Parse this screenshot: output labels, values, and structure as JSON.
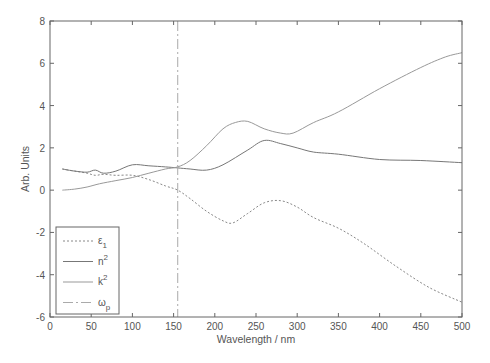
{
  "chart_data": {
    "type": "line",
    "title": "",
    "xlabel": "Wavelength / nm",
    "ylabel": "Arb. Units",
    "xlim": [
      0,
      500
    ],
    "ylim": [
      -6,
      8
    ],
    "xticks": [
      0,
      50,
      100,
      150,
      200,
      250,
      300,
      350,
      400,
      450,
      500
    ],
    "yticks": [
      -6,
      -4,
      -2,
      0,
      2,
      4,
      6,
      8
    ],
    "grid": false,
    "legend_position": "lower left",
    "series": [
      {
        "name": "ε1",
        "label_main": "ε",
        "label_sub": "1",
        "style": "dotted",
        "color": "#888888",
        "x": [
          15,
          30,
          45,
          55,
          65,
          80,
          100,
          120,
          140,
          155,
          170,
          190,
          210,
          222,
          240,
          260,
          280,
          300,
          320,
          350,
          380,
          420,
          460,
          500
        ],
        "y": [
          1.0,
          0.9,
          0.8,
          0.7,
          0.75,
          0.7,
          0.7,
          0.5,
          0.2,
          0.0,
          -0.4,
          -1.0,
          -1.45,
          -1.55,
          -1.1,
          -0.6,
          -0.5,
          -0.8,
          -1.3,
          -1.8,
          -2.5,
          -3.6,
          -4.6,
          -5.3
        ]
      },
      {
        "name": "n2",
        "label_main": "n",
        "label_sub": "2",
        "superscript": true,
        "style": "solid",
        "color": "#777777",
        "x": [
          15,
          30,
          45,
          55,
          65,
          80,
          100,
          120,
          140,
          155,
          170,
          190,
          210,
          240,
          260,
          280,
          300,
          320,
          350,
          400,
          450,
          500
        ],
        "y": [
          1.0,
          0.9,
          0.85,
          0.95,
          0.8,
          0.9,
          1.2,
          1.15,
          1.1,
          1.05,
          1.0,
          0.95,
          1.2,
          1.9,
          2.35,
          2.2,
          2.0,
          1.8,
          1.7,
          1.45,
          1.4,
          1.3
        ]
      },
      {
        "name": "k2",
        "label_main": "k",
        "label_sub": "2",
        "superscript": true,
        "style": "solid",
        "color": "#999999",
        "x": [
          15,
          30,
          45,
          60,
          80,
          100,
          120,
          140,
          155,
          170,
          190,
          210,
          225,
          240,
          260,
          280,
          295,
          320,
          350,
          400,
          450,
          480,
          500
        ],
        "y": [
          0.0,
          0.05,
          0.15,
          0.3,
          0.45,
          0.6,
          0.8,
          1.0,
          1.1,
          1.4,
          2.1,
          2.9,
          3.2,
          3.25,
          2.9,
          2.7,
          2.7,
          3.2,
          3.7,
          4.8,
          5.8,
          6.3,
          6.5
        ]
      },
      {
        "name": "ωp",
        "label_main": "ω",
        "label_sub": "p",
        "style": "dashdot",
        "color": "#aaaaaa",
        "vertical_at_x": 155
      }
    ]
  },
  "axes": {
    "xlabel": "Wavelength / nm",
    "ylabel": "Arb. Units"
  }
}
